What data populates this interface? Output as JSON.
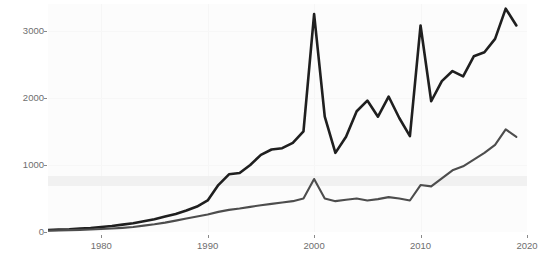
{
  "chart_data": {
    "type": "line",
    "title": "",
    "subtitle": "",
    "xlabel": "",
    "ylabel": "",
    "xlim": [
      1975,
      2020
    ],
    "ylim": [
      0,
      3400
    ],
    "grid": true,
    "legend_position": "none",
    "xticks": [
      1980,
      1990,
      2000,
      2010,
      2020
    ],
    "yticks": [
      0,
      1000,
      2000,
      3000
    ],
    "x": [
      1975,
      1976,
      1977,
      1978,
      1979,
      1980,
      1981,
      1982,
      1983,
      1984,
      1985,
      1986,
      1987,
      1988,
      1989,
      1990,
      1991,
      1992,
      1993,
      1994,
      1995,
      1996,
      1997,
      1998,
      1999,
      2000,
      2001,
      2002,
      2003,
      2004,
      2005,
      2006,
      2007,
      2008,
      2009,
      2010,
      2011,
      2012,
      2013,
      2014,
      2015,
      2016,
      2017,
      2018,
      2019
    ],
    "series": [
      {
        "name": "upper-series",
        "color": "#1f1f1f",
        "values": [
          30,
          35,
          40,
          50,
          60,
          75,
          90,
          110,
          130,
          160,
          190,
          230,
          270,
          320,
          380,
          470,
          700,
          860,
          880,
          1000,
          1150,
          1230,
          1250,
          1330,
          1500,
          3250,
          1720,
          1180,
          1420,
          1800,
          1960,
          1720,
          2020,
          1700,
          1430,
          3080,
          1950,
          2250,
          2400,
          2320,
          2620,
          2680,
          2880,
          3330,
          3080
        ]
      },
      {
        "name": "lower-series",
        "color": "#4d4d4d",
        "values": [
          20,
          24,
          28,
          32,
          38,
          45,
          52,
          62,
          75,
          95,
          115,
          140,
          170,
          200,
          230,
          260,
          300,
          330,
          350,
          375,
          400,
          420,
          440,
          460,
          500,
          790,
          500,
          460,
          480,
          500,
          470,
          490,
          520,
          500,
          470,
          700,
          680,
          800,
          920,
          980,
          1080,
          1180,
          1300,
          1530,
          1420
        ]
      }
    ],
    "highlight_band": {
      "y_from": 680,
      "y_to": 830,
      "color": "#eeeeee"
    }
  },
  "axis": {
    "y_tick_labels": [
      "3000",
      "2000",
      "1000",
      "0"
    ],
    "x_tick_labels": [
      "1980",
      "1990",
      "2000",
      "2010",
      "2020"
    ]
  }
}
